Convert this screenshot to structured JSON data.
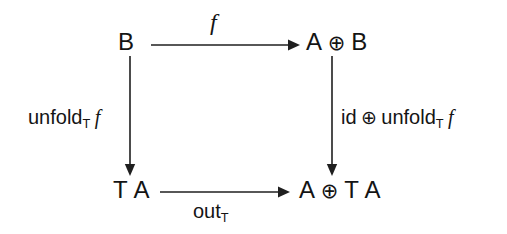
{
  "diagram": {
    "background_color": "#ffffff",
    "stroke_color": "#1f1f1f",
    "text_color": "#141414",
    "nodes": {
      "top_left": "B",
      "top_right_left": "A",
      "top_right_op": "⊕",
      "top_right_right": "B",
      "bottom_left_t": "T",
      "bottom_left_a": "A",
      "bottom_right_a": "A",
      "bottom_right_op": "⊕",
      "bottom_right_t": "T",
      "bottom_right_a2": "A"
    },
    "edges": {
      "top": {
        "label_main": "f",
        "direction": "right"
      },
      "left": {
        "label_main": "unfold",
        "label_sub": "T",
        "label_arg": "f",
        "direction": "down"
      },
      "right": {
        "label_id": "id",
        "label_op": "⊕",
        "label_main": "unfold",
        "label_sub": "T",
        "label_arg": "f",
        "direction": "down"
      },
      "bottom": {
        "label_main": "out",
        "label_sub": "T",
        "direction": "right"
      }
    }
  }
}
